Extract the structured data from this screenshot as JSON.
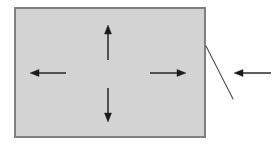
{
  "figure": {
    "type": "technical-diagram",
    "canvas": {
      "width": 279,
      "height": 148,
      "background": "#ffffff"
    },
    "shapes": {
      "rectangle": {
        "label": "gray filled rectangle",
        "x": 14,
        "y": 7,
        "width": 192,
        "height": 131,
        "fill": "#d3d3d3",
        "stroke": "#808080",
        "stroke_width": 2
      }
    },
    "arrows": {
      "stroke": "#1a1a1a",
      "stroke_width": 1.4,
      "head_length": 9,
      "head_width": 7,
      "items": [
        {
          "name": "arrow-up",
          "direction": "up",
          "from_x": 108,
          "from_y": 60,
          "to_x": 108,
          "to_y": 25
        },
        {
          "name": "arrow-down",
          "direction": "down",
          "from_x": 108,
          "from_y": 88,
          "to_x": 108,
          "to_y": 122
        },
        {
          "name": "arrow-left",
          "direction": "left",
          "from_x": 66,
          "from_y": 73,
          "to_x": 30,
          "to_y": 73
        },
        {
          "name": "arrow-right",
          "direction": "right",
          "from_x": 150,
          "from_y": 73,
          "to_x": 186,
          "to_y": 73
        },
        {
          "name": "arrow-external-left",
          "direction": "left",
          "from_x": 271,
          "from_y": 73,
          "to_x": 234,
          "to_y": 73
        }
      ]
    },
    "leader_line": {
      "name": "leader-line",
      "from_x": 206,
      "from_y": 46,
      "to_x": 233,
      "to_y": 99,
      "stroke": "#4d4d4d",
      "stroke_width": 1.1
    }
  }
}
